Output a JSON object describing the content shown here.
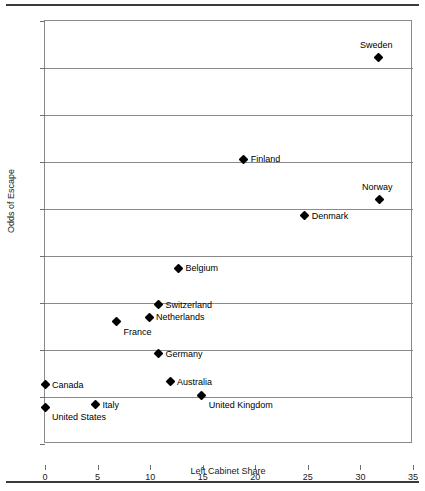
{
  "chart_data": {
    "type": "scatter",
    "title": "",
    "xlabel": "Left Cabinet Share",
    "ylabel": "Odds of Escape",
    "xlim": [
      0,
      35
    ],
    "ylim": [
      0,
      45
    ],
    "xticks": [
      0,
      5,
      10,
      15,
      20,
      25,
      30,
      35
    ],
    "yticks": [
      0,
      5,
      10,
      15,
      20,
      25,
      30,
      35,
      40,
      45
    ],
    "grid": "horizontal",
    "legend": "none",
    "marker": "filled-diamond",
    "points": [
      {
        "label": "Sweden",
        "x": 31.7,
        "y": 41.1,
        "label_pos": "above"
      },
      {
        "label": "Norway",
        "x": 31.8,
        "y": 26.0,
        "label_pos": "above"
      },
      {
        "label": "Finland",
        "x": 18.9,
        "y": 30.3,
        "label_pos": "right"
      },
      {
        "label": "Denmark",
        "x": 24.7,
        "y": 24.3,
        "label_pos": "right"
      },
      {
        "label": "Belgium",
        "x": 12.7,
        "y": 18.7,
        "label_pos": "right"
      },
      {
        "label": "Switzerland",
        "x": 10.8,
        "y": 14.8,
        "label_pos": "right"
      },
      {
        "label": "Netherlands",
        "x": 9.9,
        "y": 13.5,
        "label_pos": "right"
      },
      {
        "label": "France",
        "x": 6.8,
        "y": 13.0,
        "label_pos": "below-right"
      },
      {
        "label": "Germany",
        "x": 10.8,
        "y": 9.6,
        "label_pos": "right"
      },
      {
        "label": "Australia",
        "x": 11.9,
        "y": 6.6,
        "label_pos": "right"
      },
      {
        "label": "Canada",
        "x": 0.0,
        "y": 6.3,
        "label_pos": "right"
      },
      {
        "label": "United Kingdom",
        "x": 14.9,
        "y": 5.2,
        "label_pos": "below-right"
      },
      {
        "label": "Italy",
        "x": 4.8,
        "y": 4.2,
        "label_pos": "right"
      },
      {
        "label": "United States",
        "x": 0.0,
        "y": 3.9,
        "label_pos": "below-right"
      }
    ]
  }
}
